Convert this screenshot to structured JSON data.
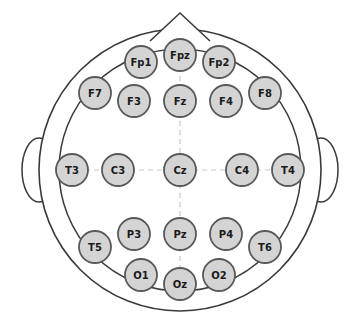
{
  "figure": {
    "view": "superior (top-down), nose at top",
    "colors": {
      "background": "#ffffff",
      "head_outline": "#3a3a3a",
      "electrode_fill": "#d4d4d4",
      "electrode_border": "#595959",
      "label_text": "#1a1a1a",
      "axis_dashed": "#c9c9c9"
    }
  },
  "anatomy": {
    "nose": {
      "name": "nose-marker",
      "cx": 180,
      "cy": 13,
      "width": 60,
      "height": 28
    },
    "left_ear": {
      "name": "left-ear-marker",
      "cx": 39,
      "cy": 170,
      "rx": 17,
      "ry": 32
    },
    "right_ear": {
      "name": "right-ear-marker",
      "cx": 321,
      "cy": 170,
      "rx": 17,
      "ry": 32
    },
    "head_circle": {
      "cx": 180,
      "cy": 170,
      "rx": 141,
      "ry": 141
    },
    "inner_circle": {
      "cx": 180,
      "cy": 170,
      "rx": 121,
      "ry": 121
    }
  },
  "axes": {
    "vertical_midline": {
      "x": 180,
      "y1": 40,
      "y2": 300,
      "style": "dashed"
    },
    "horizontal_midline": {
      "y": 170,
      "x1": 58,
      "x2": 302,
      "style": "dashed"
    }
  },
  "electrodes": [
    {
      "label": "Fp1",
      "cx": 141,
      "cy": 62,
      "r": 16,
      "region": "prefrontal",
      "hemisphere": "left",
      "font_size": 10
    },
    {
      "label": "Fpz",
      "cx": 180,
      "cy": 55,
      "r": 16,
      "region": "prefrontal",
      "hemisphere": "midline",
      "font_size": 10
    },
    {
      "label": "Fp2",
      "cx": 219,
      "cy": 62,
      "r": 16,
      "region": "prefrontal",
      "hemisphere": "right",
      "font_size": 10
    },
    {
      "label": "F7",
      "cx": 95,
      "cy": 93,
      "r": 16,
      "region": "frontal",
      "hemisphere": "left",
      "font_size": 10
    },
    {
      "label": "F3",
      "cx": 134,
      "cy": 101,
      "r": 16,
      "region": "frontal",
      "hemisphere": "left",
      "font_size": 10
    },
    {
      "label": "Fz",
      "cx": 180,
      "cy": 101,
      "r": 16,
      "region": "frontal",
      "hemisphere": "midline",
      "font_size": 10
    },
    {
      "label": "F4",
      "cx": 226,
      "cy": 101,
      "r": 16,
      "region": "frontal",
      "hemisphere": "right",
      "font_size": 10
    },
    {
      "label": "F8",
      "cx": 265,
      "cy": 93,
      "r": 16,
      "region": "frontal",
      "hemisphere": "right",
      "font_size": 10
    },
    {
      "label": "T3",
      "cx": 72,
      "cy": 170,
      "r": 16,
      "region": "temporal",
      "hemisphere": "left",
      "font_size": 10
    },
    {
      "label": "C3",
      "cx": 118,
      "cy": 170,
      "r": 16,
      "region": "central",
      "hemisphere": "left",
      "font_size": 10
    },
    {
      "label": "Cz",
      "cx": 180,
      "cy": 170,
      "r": 16,
      "region": "central",
      "hemisphere": "midline",
      "font_size": 10
    },
    {
      "label": "C4",
      "cx": 242,
      "cy": 170,
      "r": 16,
      "region": "central",
      "hemisphere": "right",
      "font_size": 10
    },
    {
      "label": "T4",
      "cx": 288,
      "cy": 170,
      "r": 16,
      "region": "temporal",
      "hemisphere": "right",
      "font_size": 10
    },
    {
      "label": "T5",
      "cx": 95,
      "cy": 247,
      "r": 16,
      "region": "temporal",
      "hemisphere": "left",
      "font_size": 10
    },
    {
      "label": "P3",
      "cx": 134,
      "cy": 234,
      "r": 16,
      "region": "parietal",
      "hemisphere": "left",
      "font_size": 10
    },
    {
      "label": "Pz",
      "cx": 180,
      "cy": 234,
      "r": 16,
      "region": "parietal",
      "hemisphere": "midline",
      "font_size": 10
    },
    {
      "label": "P4",
      "cx": 226,
      "cy": 234,
      "r": 16,
      "region": "parietal",
      "hemisphere": "right",
      "font_size": 10
    },
    {
      "label": "T6",
      "cx": 265,
      "cy": 247,
      "r": 16,
      "region": "temporal",
      "hemisphere": "right",
      "font_size": 10
    },
    {
      "label": "O1",
      "cx": 141,
      "cy": 275,
      "r": 16,
      "region": "occipital",
      "hemisphere": "left",
      "font_size": 10
    },
    {
      "label": "Oz",
      "cx": 180,
      "cy": 284,
      "r": 16,
      "region": "occipital",
      "hemisphere": "midline",
      "font_size": 10
    },
    {
      "label": "O2",
      "cx": 219,
      "cy": 275,
      "r": 16,
      "region": "occipital",
      "hemisphere": "right",
      "font_size": 10
    }
  ]
}
